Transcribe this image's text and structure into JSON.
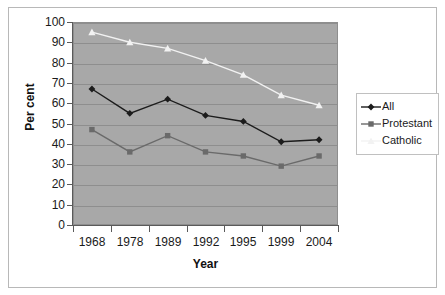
{
  "chart_data": {
    "type": "line",
    "title": "",
    "subtitle": "",
    "xlabel": "Year",
    "ylabel": "Per cent",
    "categories": [
      "1968",
      "1978",
      "1989",
      "1992",
      "1995",
      "1999",
      "2004"
    ],
    "ylim": [
      0,
      100
    ],
    "ytick_step": 10,
    "yticks": [
      "100",
      "90",
      "80",
      "70",
      "60",
      "50",
      "40",
      "30",
      "20",
      "10",
      "0"
    ],
    "grid": true,
    "grid_axis": "y",
    "legend_position": "right",
    "plot_background": "#a8a8a8",
    "series": [
      {
        "name": "All",
        "values": [
          67,
          55,
          62,
          54,
          51,
          41,
          42
        ],
        "color": "#1c1c1c",
        "marker": "diamond"
      },
      {
        "name": "Protestant",
        "values": [
          47,
          36,
          44,
          36,
          34,
          29,
          34
        ],
        "color": "#6a6a6a",
        "marker": "square"
      },
      {
        "name": "Catholic",
        "values": [
          95,
          90,
          87,
          81,
          74,
          64,
          59
        ],
        "color": "#f2f2f2",
        "marker": "triangle"
      }
    ]
  },
  "legend": {
    "items": [
      {
        "label": "All"
      },
      {
        "label": "Protestant"
      },
      {
        "label": "Catholic"
      }
    ]
  },
  "axes": {
    "x_title": "Year",
    "y_title": "Per cent"
  }
}
